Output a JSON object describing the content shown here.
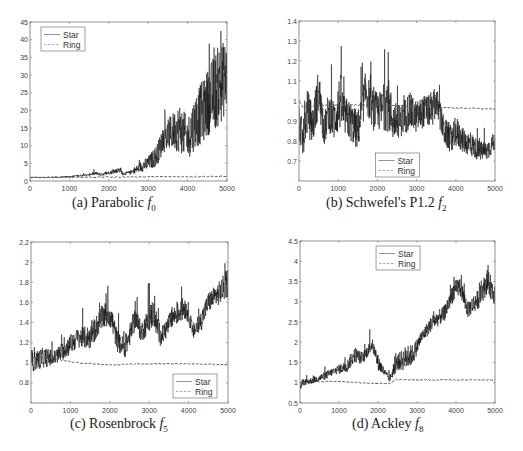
{
  "figure": {
    "background": "#ffffff",
    "line_color_star": "#111111",
    "line_color_ring": "#555555",
    "axis_color": "#777777"
  },
  "chart_data": [
    {
      "id": "a",
      "type": "line",
      "caption_prefix": "(a) Parabolic ",
      "caption_func": "f",
      "caption_sub": "0",
      "xlabel": "",
      "ylabel": "",
      "xlim": [
        0,
        5000
      ],
      "ylim": [
        0,
        45
      ],
      "xticks": [
        0,
        1000,
        2000,
        3000,
        4000,
        5000
      ],
      "yticks": [
        0,
        5,
        10,
        15,
        20,
        25,
        30,
        35,
        40,
        45
      ],
      "legend": {
        "position": "upper-left",
        "entries": [
          "Star",
          "Ring"
        ]
      },
      "series": [
        {
          "name": "Star",
          "style": "solid",
          "band": 0.25,
          "x": [
            0,
            500,
            1000,
            1500,
            1700,
            1800,
            2000,
            2300,
            2350,
            2600,
            2800,
            3000,
            3200,
            3400,
            3600,
            3800,
            4000,
            4200,
            4400,
            4600,
            4800,
            5000
          ],
          "y": [
            1,
            1,
            1.2,
            1.8,
            2.2,
            1.8,
            2.3,
            3.2,
            2.0,
            2.5,
            4,
            5,
            7,
            12,
            14,
            15,
            12,
            17,
            20,
            24,
            27,
            30
          ],
          "spread": [
            0.1,
            0.1,
            0.2,
            0.3,
            0.5,
            0.4,
            0.5,
            0.8,
            0.4,
            0.6,
            1.5,
            2,
            3,
            4,
            5,
            7,
            6,
            8,
            9,
            10,
            12,
            10
          ]
        },
        {
          "name": "Ring",
          "style": "dashed",
          "x": [
            0,
            5000
          ],
          "y": [
            1,
            1.3
          ],
          "spread": [
            0,
            0
          ]
        }
      ]
    },
    {
      "id": "b",
      "type": "line",
      "caption_prefix": "(b) Schwefel's P1.2 ",
      "caption_func": "f",
      "caption_sub": "2",
      "xlabel": "",
      "ylabel": "",
      "xlim": [
        0,
        5000
      ],
      "ylim": [
        0.6,
        1.4
      ],
      "xticks": [
        0,
        1000,
        2000,
        3000,
        4000,
        5000
      ],
      "yticks": [
        0.7,
        0.8,
        0.9,
        1,
        1.1,
        1.2,
        1.3,
        1.4
      ],
      "legend": {
        "position": "lower-center",
        "entries": [
          "Star",
          "Ring"
        ]
      },
      "series": [
        {
          "name": "Star",
          "style": "solid",
          "x": [
            0,
            100,
            200,
            350,
            500,
            650,
            750,
            900,
            1050,
            1150,
            1300,
            1500,
            1700,
            1900,
            2100,
            2250,
            2400,
            2600,
            2800,
            3000,
            3200,
            3400,
            3500,
            3700,
            3900,
            4000,
            4200,
            4400,
            4600,
            4800,
            5000
          ],
          "y": [
            0.9,
            0.8,
            0.95,
            0.88,
            1.05,
            0.85,
            0.95,
            0.9,
            1.0,
            0.93,
            0.9,
            0.85,
            1.05,
            0.95,
            0.95,
            1.0,
            0.9,
            0.9,
            0.95,
            0.92,
            0.95,
            0.95,
            1.0,
            0.85,
            0.8,
            0.85,
            0.8,
            0.78,
            0.75,
            0.75,
            0.8
          ],
          "spread": [
            0.1,
            0.08,
            0.12,
            0.1,
            0.12,
            0.08,
            0.1,
            0.1,
            0.15,
            0.1,
            0.1,
            0.1,
            0.1,
            0.1,
            0.1,
            0.15,
            0.1,
            0.08,
            0.1,
            0.08,
            0.08,
            0.08,
            0.08,
            0.07,
            0.07,
            0.08,
            0.06,
            0.06,
            0.05,
            0.05,
            0.05
          ]
        },
        {
          "name": "Ring",
          "style": "dashed",
          "x": [
            0,
            100,
            300,
            1000,
            2000,
            3000,
            3500,
            4000,
            5000
          ],
          "y": [
            1.0,
            0.97,
            0.975,
            0.98,
            0.98,
            0.975,
            0.97,
            0.965,
            0.96
          ],
          "spread": [
            0,
            0,
            0,
            0,
            0,
            0,
            0,
            0,
            0
          ]
        }
      ]
    },
    {
      "id": "c",
      "type": "line",
      "caption_prefix": "(c) Rosenbrock ",
      "caption_func": "f",
      "caption_sub": "5",
      "xlabel": "",
      "ylabel": "",
      "xlim": [
        0,
        5000
      ],
      "ylim": [
        0.6,
        2.2
      ],
      "xticks": [
        0,
        1000,
        2000,
        3000,
        4000,
        5000
      ],
      "yticks": [
        0.8,
        1,
        1.2,
        1.4,
        1.6,
        1.8,
        2,
        2.2
      ],
      "legend": {
        "position": "lower-right",
        "entries": [
          "Star",
          "Ring"
        ]
      },
      "series": [
        {
          "name": "Star",
          "style": "solid",
          "x": [
            0,
            300,
            600,
            900,
            1200,
            1500,
            1800,
            2000,
            2200,
            2400,
            2650,
            2800,
            3100,
            3300,
            3600,
            3900,
            4000,
            4100,
            4300,
            4500,
            4800,
            5000
          ],
          "y": [
            1.0,
            1.05,
            1.05,
            1.15,
            1.25,
            1.25,
            1.45,
            1.5,
            1.2,
            1.15,
            1.45,
            1.3,
            1.5,
            1.25,
            1.45,
            1.55,
            1.5,
            1.3,
            1.4,
            1.6,
            1.7,
            1.8
          ],
          "spread": [
            0.1,
            0.1,
            0.08,
            0.1,
            0.1,
            0.12,
            0.12,
            0.15,
            0.1,
            0.1,
            0.12,
            0.1,
            0.15,
            0.1,
            0.1,
            0.12,
            0.1,
            0.08,
            0.1,
            0.1,
            0.12,
            0.15
          ]
        },
        {
          "name": "Ring",
          "style": "dashed",
          "x": [
            0,
            500,
            800,
            1200,
            2000,
            3000,
            4000,
            5000
          ],
          "y": [
            1.05,
            1.05,
            1.02,
            1.0,
            0.98,
            0.99,
            0.99,
            0.98
          ],
          "spread": [
            0,
            0,
            0,
            0,
            0,
            0,
            0,
            0
          ]
        }
      ]
    },
    {
      "id": "d",
      "type": "line",
      "caption_prefix": "(d) Ackley ",
      "caption_func": "f",
      "caption_sub": "8",
      "xlabel": "",
      "ylabel": "",
      "xlim": [
        0,
        5000
      ],
      "ylim": [
        0.5,
        4.5
      ],
      "xticks": [
        0,
        1000,
        2000,
        3000,
        4000,
        5000
      ],
      "yticks": [
        0.5,
        1,
        1.5,
        2,
        2.5,
        3,
        3.5,
        4,
        4.5
      ],
      "legend": {
        "position": "upper-center",
        "entries": [
          "Star",
          "Ring"
        ]
      },
      "series": [
        {
          "name": "Star",
          "style": "solid",
          "x": [
            0,
            50,
            300,
            600,
            900,
            1200,
            1400,
            1600,
            1850,
            2000,
            2200,
            2300,
            2500,
            2700,
            2900,
            3100,
            3400,
            3700,
            3900,
            4100,
            4300,
            4600,
            4800,
            5000
          ],
          "y": [
            0.8,
            1.0,
            1.05,
            1.15,
            1.3,
            1.4,
            1.7,
            1.6,
            1.95,
            1.5,
            1.2,
            1.1,
            1.5,
            1.6,
            1.7,
            2.1,
            2.5,
            2.7,
            3.2,
            3.4,
            2.8,
            3.1,
            3.5,
            3.2
          ],
          "spread": [
            0.1,
            0.08,
            0.08,
            0.1,
            0.1,
            0.15,
            0.2,
            0.15,
            0.15,
            0.2,
            0.1,
            0.08,
            0.2,
            0.3,
            0.25,
            0.15,
            0.2,
            0.2,
            0.25,
            0.25,
            0.2,
            0.25,
            0.3,
            0.3
          ]
        },
        {
          "name": "Ring",
          "style": "dashed",
          "x": [
            0,
            500,
            1000,
            1500,
            2000,
            2300,
            2450,
            3000,
            4000,
            5000
          ],
          "y": [
            1.0,
            1.03,
            1.03,
            1.0,
            0.98,
            0.98,
            1.08,
            1.07,
            1.07,
            1.07
          ],
          "spread": [
            0,
            0,
            0,
            0,
            0,
            0,
            0,
            0,
            0,
            0
          ]
        }
      ]
    }
  ],
  "layout": {
    "panels": [
      {
        "id": "a",
        "left": 30,
        "top": 22,
        "width": 197,
        "height": 159,
        "caption_x": 72,
        "caption_y": 197
      },
      {
        "id": "b",
        "left": 299,
        "top": 21,
        "width": 196,
        "height": 160,
        "caption_x": 326,
        "caption_y": 197
      },
      {
        "id": "c",
        "left": 31,
        "top": 242,
        "width": 197,
        "height": 161,
        "caption_x": 70,
        "caption_y": 418
      },
      {
        "id": "d",
        "left": 300,
        "top": 241,
        "width": 195,
        "height": 162,
        "caption_x": 352,
        "caption_y": 418
      }
    ]
  }
}
